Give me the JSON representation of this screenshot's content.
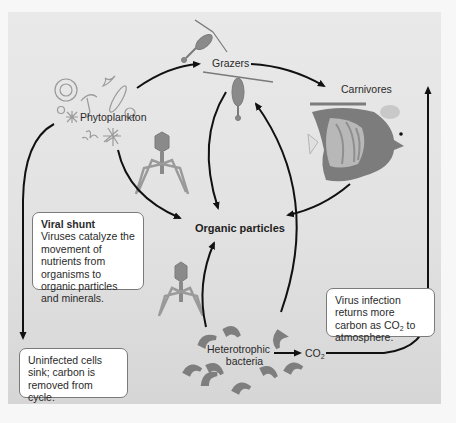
{
  "diagram": {
    "nodes": {
      "phytoplankton": "Phytoplankton",
      "grazers": "Grazers",
      "carnivores": "Carnivores",
      "organic_particles": "Organic particles",
      "heterotrophic_bacteria_line1": "Heterotrophic",
      "heterotrophic_bacteria_line2": "bacteria",
      "co2_base": "CO",
      "co2_sub": "2"
    },
    "callouts": {
      "viral_shunt": {
        "title": "Viral shunt",
        "body": "Viruses catalyze the movement of nutrients from organisms to organic particles and minerals."
      },
      "uninfected": {
        "body": "Uninfected cells sink; carbon is removed from cycle."
      },
      "virus_infection": {
        "body_pre": "Virus infection returns more carbon as CO",
        "body_sub": "2",
        "body_post": " to atmosphere."
      }
    },
    "edges": [
      {
        "from": "Phytoplankton",
        "to": "Grazers"
      },
      {
        "from": "Grazers",
        "to": "Carnivores"
      },
      {
        "from": "Phytoplankton",
        "to": "Organic particles"
      },
      {
        "from": "Grazers",
        "to": "Organic particles"
      },
      {
        "from": "Carnivores",
        "to": "Organic particles"
      },
      {
        "from": "Heterotrophic bacteria",
        "to": "Organic particles"
      },
      {
        "from": "Heterotrophic bacteria",
        "to": "Grazers"
      },
      {
        "from": "Heterotrophic bacteria",
        "to": "CO2"
      },
      {
        "from": "CO2",
        "to": "atmosphere (up)"
      },
      {
        "from": "Phytoplankton",
        "to": "Uninfected cells sink"
      }
    ],
    "icons": [
      "phytoplankton-cluster-icon",
      "copepod-icon",
      "fish-icon",
      "bacteriophage-icon",
      "bacteria-icon"
    ],
    "colors": {
      "background": "#e6e6e6",
      "arrow": "#111111",
      "callout_bg": "#ffffff",
      "organism_gray": "#8a8a8a"
    }
  }
}
